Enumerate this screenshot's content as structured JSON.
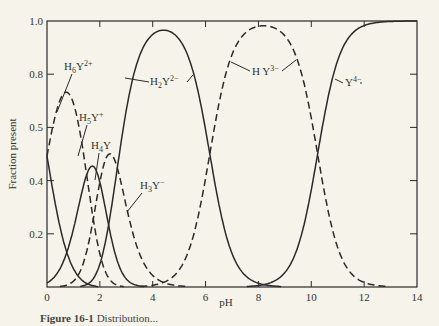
{
  "chart_data": {
    "type": "line",
    "title": "",
    "xlabel": "pH",
    "ylabel": "Fraction present",
    "xlim": [
      0,
      14
    ],
    "ylim": [
      0,
      1.0
    ],
    "grid": false,
    "legend": "inline labels on curves",
    "x_ticks": [
      0,
      2,
      4,
      6,
      8,
      10,
      12,
      14
    ],
    "y_ticks": [
      {
        "value": 0.2,
        "label": "0.2"
      },
      {
        "value": 0.4,
        "label": "0.4"
      },
      {
        "value": 0.6,
        "label": "0.5"
      },
      {
        "value": 0.8,
        "label": "0.8"
      },
      {
        "value": 1.0,
        "label": "1.0"
      }
    ],
    "pKa": [
      0.0,
      1.5,
      2.0,
      2.66,
      6.16,
      10.24
    ],
    "series": [
      {
        "name": "H6Y2+",
        "style": "solid",
        "label_base": "H",
        "label_sub": "6",
        "label_rest": "Y",
        "label_sup": "2+",
        "peak": {
          "pH": 0,
          "fraction": 0.87
        }
      },
      {
        "name": "H5Y+",
        "style": "dashed",
        "label_base": "H",
        "label_sub": "5",
        "label_rest": "Y",
        "label_sup": "+",
        "peak": {
          "pH": 1.1,
          "fraction": 0.49
        }
      },
      {
        "name": "H4Y",
        "style": "solid",
        "label_base": "H",
        "label_sub": "4",
        "label_rest": "Y",
        "label_sup": "",
        "peak": {
          "pH": 1.8,
          "fraction": 0.41
        }
      },
      {
        "name": "H3Y-",
        "style": "dashed",
        "label_base": "H",
        "label_sub": "3",
        "label_rest": "Y",
        "label_sup": "−",
        "peak": {
          "pH": 2.4,
          "fraction": 0.48
        }
      },
      {
        "name": "H2Y2-",
        "style": "solid",
        "label_base": "H",
        "label_sub": "2",
        "label_rest": "Y",
        "label_sup": "2−",
        "peak": {
          "pH": 4.4,
          "fraction": 0.97
        }
      },
      {
        "name": "HY3-",
        "style": "dashed",
        "label_base": "H Y",
        "label_sub": "",
        "label_rest": "",
        "label_sup": "3−",
        "peak": {
          "pH": 8.2,
          "fraction": 0.99
        }
      },
      {
        "name": "Y4-",
        "style": "solid",
        "label_base": "Y",
        "label_sub": "",
        "label_rest": "",
        "label_sup": "4−",
        "peak": {
          "pH": 14,
          "fraction": 1.0
        }
      }
    ],
    "annotations": [
      {
        "series": "H6Y2+",
        "x": 64,
        "y": 70,
        "leader": [
          [
            72,
            74
          ],
          [
            57,
            112
          ]
        ]
      },
      {
        "series": "H5Y+",
        "x": 79,
        "y": 121,
        "leader": [
          [
            87,
            125
          ],
          [
            78,
            156
          ]
        ]
      },
      {
        "series": "H4Y",
        "x": 91,
        "y": 149,
        "leader": [
          [
            99,
            153
          ],
          [
            95,
            180
          ]
        ]
      },
      {
        "series": "H3Y-",
        "x": 140,
        "y": 189,
        "leader": [
          [
            142,
            193
          ],
          [
            127,
            212
          ]
        ]
      },
      {
        "series": "H2Y2-",
        "x": 150,
        "y": 85,
        "leader_left": [
          [
            125,
            78
          ],
          [
            149,
            82
          ]
        ],
        "leader_right": [
          [
            187,
            82
          ],
          [
            193,
            75
          ]
        ]
      },
      {
        "series": "HY3-",
        "x": 252,
        "y": 75,
        "leader_left": [
          [
            231,
            62
          ],
          [
            250,
            71
          ]
        ],
        "leader_right": [
          [
            282,
            71
          ],
          [
            296,
            60
          ]
        ]
      },
      {
        "series": "Y4-",
        "x": 345,
        "y": 86,
        "leader_left": [
          [
            335,
            79
          ],
          [
            343,
            83
          ]
        ],
        "leader_right": [
          [
            360,
            83
          ],
          [
            362,
            83
          ]
        ]
      }
    ]
  },
  "caption": {
    "label": "Figure 16-1",
    "text": "Distribution..."
  }
}
